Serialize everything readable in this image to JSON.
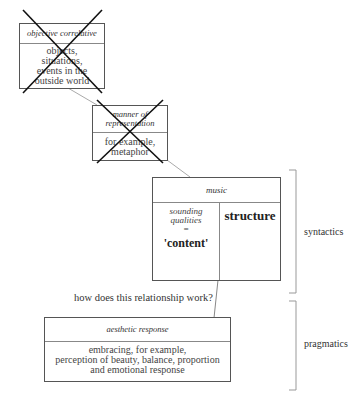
{
  "boxes": {
    "objective_correlative": {
      "title": "objective correlative",
      "lines": [
        "objects,",
        "situations,",
        "events in the",
        "outside world"
      ],
      "crossed_out": true
    },
    "manner_of_representation": {
      "title_lines": [
        "manner of",
        "representation"
      ],
      "lines": [
        "for example,",
        "metaphor"
      ],
      "crossed_out": true
    },
    "music": {
      "title": "music",
      "left_italic_lines": [
        "sounding",
        "qualities",
        "="
      ],
      "left_bold": "'content'",
      "right_bold": "structure"
    },
    "aesthetic_response": {
      "title": "aesthetic response",
      "lines": [
        "embracing, for example,",
        "perception of beauty, balance, proportion",
        "and emotional response"
      ]
    }
  },
  "question": "how does this relationship work?",
  "brackets": {
    "upper": "syntactics",
    "lower": "pragmatics"
  },
  "colors": {
    "line": "#555555",
    "connector": "#aaaaaa",
    "cross": "#111111"
  }
}
